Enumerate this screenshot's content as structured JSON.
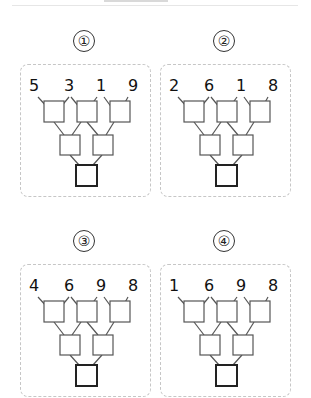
{
  "header": {
    "partial_text": ""
  },
  "panels": [
    {
      "label": "①",
      "inputs": [
        "5",
        "3",
        "1",
        "9"
      ]
    },
    {
      "label": "②",
      "inputs": [
        "2",
        "6",
        "1",
        "8"
      ]
    },
    {
      "label": "③",
      "inputs": [
        "4",
        "6",
        "9",
        "8"
      ]
    },
    {
      "label": "④",
      "inputs": [
        "1",
        "6",
        "9",
        "8"
      ]
    }
  ],
  "structure": {
    "levels": [
      {
        "name": "top",
        "boxes": 3
      },
      {
        "name": "middle",
        "boxes": 2
      },
      {
        "name": "bottom",
        "boxes": 1,
        "emphasis": "thick-border"
      }
    ],
    "colors": {
      "line": "#555555",
      "box_border": "#555555",
      "bottom_border": "#222222",
      "frame": "#c6c6c6"
    }
  }
}
